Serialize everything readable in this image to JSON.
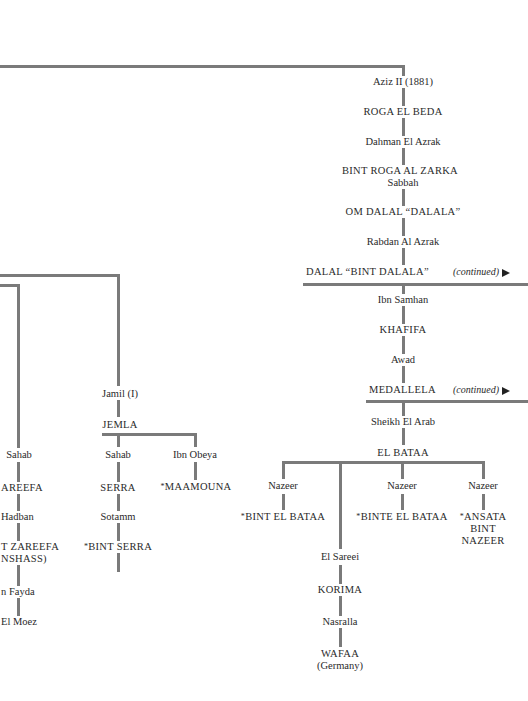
{
  "right_branch": {
    "nodes": [
      {
        "id": "aziz",
        "label": "Aziz II (1881)"
      },
      {
        "id": "roga",
        "label": "ROGA EL BEDA"
      },
      {
        "id": "dahman",
        "label": "Dahman El Azrak"
      },
      {
        "id": "bint_roga",
        "label": "BINT ROGA AL ZARKA"
      },
      {
        "id": "sabbah",
        "label": "Sabbah"
      },
      {
        "id": "om_dalal",
        "label": "OM DALAL “DALALA”"
      },
      {
        "id": "rabdan",
        "label": "Rabdan Al Azrak"
      },
      {
        "id": "dalal",
        "label": "DALAL “BINT DALALA”"
      },
      {
        "id": "ibn_samhan",
        "label": "Ibn Samhan"
      },
      {
        "id": "khafifa",
        "label": "KHAFIFA"
      },
      {
        "id": "awad",
        "label": "Awad"
      },
      {
        "id": "medallela",
        "label": "MEDALLELA"
      },
      {
        "id": "sheikh",
        "label": "Sheikh El Arab"
      },
      {
        "id": "el_bataa",
        "label": "EL BATAA"
      }
    ],
    "continued_label": "(continued)",
    "el_bataa_children": [
      {
        "sire": "Nazeer",
        "offspring": "BINT EL BATAA",
        "star": "*"
      },
      {
        "sire": "Nazeer",
        "offspring": "BINTE EL BATAA",
        "star": "*"
      },
      {
        "sire": "Nazeer",
        "offspring_lines": [
          "ANSATA",
          "BINT",
          "NAZEER"
        ],
        "star": "*"
      }
    ],
    "sareei_line": [
      {
        "label": "El Sareei"
      },
      {
        "label": "KORIMA"
      },
      {
        "label": "Nasralla"
      },
      {
        "label": "WAFAA"
      },
      {
        "label": "(Germany)"
      }
    ]
  },
  "middle_branch": {
    "jamil": "Jamil (I)",
    "jemla": "JEMLA",
    "sahab": "Sahab",
    "serra": "SERRA",
    "sotamm": "Sotamm",
    "bint_serra": "BINT SERRA",
    "ibn_obeya": "Ibn Obeya",
    "maamouna": "MAAMOUNA",
    "star": "*"
  },
  "left_branch": {
    "sahab": "Sahab",
    "zareefa": "AREEFA",
    "hadban": "Hadban",
    "bint_zareefa": "T ZAREEFA",
    "inshass": "NSHASS)",
    "ibn_fayda": "n Fayda",
    "el_moez": "El Moez"
  }
}
